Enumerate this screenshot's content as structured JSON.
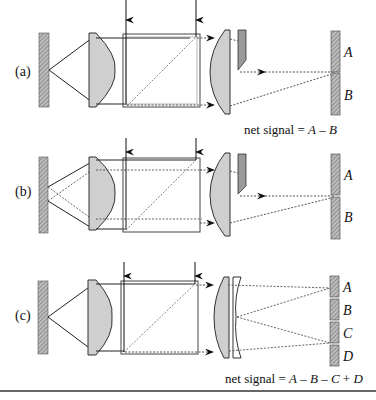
{
  "figure": {
    "panels": [
      {
        "id": "a",
        "label": "(a)",
        "detector_segments": [
          "A",
          "B"
        ],
        "net_signal": "net signal = A – B"
      },
      {
        "id": "b",
        "label": "(b)",
        "detector_segments": [
          "A",
          "B"
        ],
        "net_signal": ""
      },
      {
        "id": "c",
        "label": "(c)",
        "detector_segments": [
          "A",
          "B",
          "C",
          "D"
        ],
        "net_signal": "net signal = A – B – C + D"
      }
    ],
    "colors": {
      "lens_fill": "#cfcfcf",
      "knife_fill": "#9a9a9a",
      "hatch": "#8a8a8a",
      "line": "#222222"
    }
  }
}
